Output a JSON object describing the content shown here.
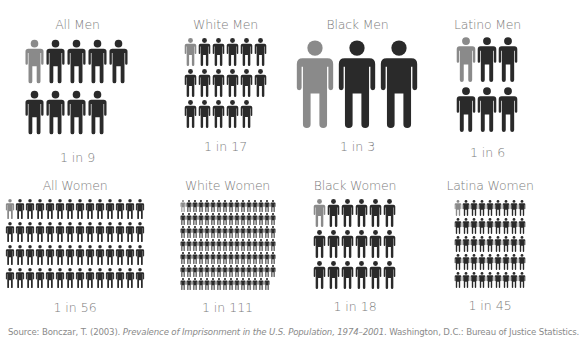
{
  "colors": {
    "highlight": "#8a8a8a",
    "figure": "#2a2a2a",
    "text": "#7d7d7d"
  },
  "chart_data": {
    "type": "pictograph",
    "title": "",
    "groups": [
      {
        "label": "All Men",
        "ratio_label": "1 in 9",
        "one_in": 9,
        "columns": 5
      },
      {
        "label": "White Men",
        "ratio_label": "1 in 17",
        "one_in": 17,
        "columns": 6
      },
      {
        "label": "Black Men",
        "ratio_label": "1 in 3",
        "one_in": 3,
        "columns": 3
      },
      {
        "label": "Latino Men",
        "ratio_label": "1 in 6",
        "one_in": 6,
        "columns": 3
      },
      {
        "label": "All Women",
        "ratio_label": "1 in 56",
        "one_in": 56,
        "columns": 14
      },
      {
        "label": "White Women",
        "ratio_label": "1 in 111",
        "one_in": 111,
        "columns": 16
      },
      {
        "label": "Black Women",
        "ratio_label": "1 in 18",
        "one_in": 18,
        "columns": 6
      },
      {
        "label": "Latina Women",
        "ratio_label": "1 in 45",
        "one_in": 45,
        "columns": 9
      }
    ],
    "source": {
      "prefix": "Source: Bonczar, T. (2003). ",
      "title_italic": "Prevalence of Imprisonment in the U.S. Population, 1974–2001",
      "suffix": ". Washington, D.C.: Bureau of Justice Statistics."
    }
  }
}
